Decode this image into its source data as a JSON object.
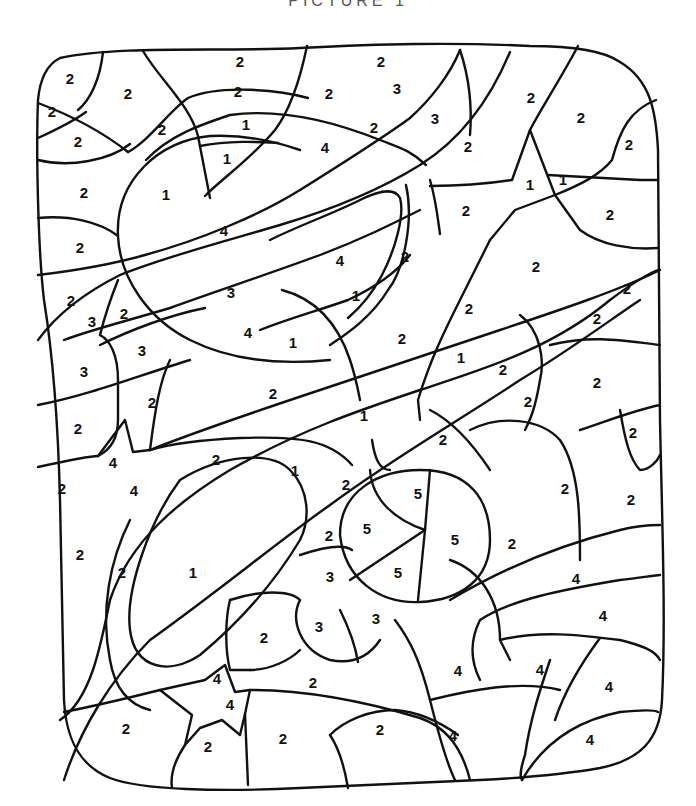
{
  "page": {
    "title": "PICTURE 1",
    "line_color": "#111111",
    "background": "#ffffff"
  },
  "numbers": [
    {
      "v": "2",
      "x": 70,
      "y": 80
    },
    {
      "v": "2",
      "x": 128,
      "y": 95
    },
    {
      "v": "2",
      "x": 52,
      "y": 113
    },
    {
      "v": "2",
      "x": 78,
      "y": 143
    },
    {
      "v": "2",
      "x": 240,
      "y": 63
    },
    {
      "v": "2",
      "x": 238,
      "y": 93
    },
    {
      "v": "2",
      "x": 162,
      "y": 131
    },
    {
      "v": "1",
      "x": 246,
      "y": 126
    },
    {
      "v": "1",
      "x": 227,
      "y": 160
    },
    {
      "v": "2",
      "x": 84,
      "y": 194
    },
    {
      "v": "1",
      "x": 166,
      "y": 196
    },
    {
      "v": "4",
      "x": 224,
      "y": 232
    },
    {
      "v": "2",
      "x": 80,
      "y": 249
    },
    {
      "v": "2",
      "x": 381,
      "y": 63
    },
    {
      "v": "2",
      "x": 329,
      "y": 95
    },
    {
      "v": "3",
      "x": 397,
      "y": 90
    },
    {
      "v": "2",
      "x": 374,
      "y": 129
    },
    {
      "v": "3",
      "x": 435,
      "y": 120
    },
    {
      "v": "4",
      "x": 325,
      "y": 149
    },
    {
      "v": "2",
      "x": 468,
      "y": 148
    },
    {
      "v": "2",
      "x": 531,
      "y": 99
    },
    {
      "v": "2",
      "x": 581,
      "y": 119
    },
    {
      "v": "2",
      "x": 629,
      "y": 146
    },
    {
      "v": "1",
      "x": 530,
      "y": 186
    },
    {
      "v": "1",
      "x": 563,
      "y": 181
    },
    {
      "v": "2",
      "x": 466,
      "y": 212
    },
    {
      "v": "2",
      "x": 610,
      "y": 216
    },
    {
      "v": "2",
      "x": 536,
      "y": 268
    },
    {
      "v": "2",
      "x": 627,
      "y": 290
    },
    {
      "v": "4",
      "x": 340,
      "y": 262
    },
    {
      "v": "2",
      "x": 405,
      "y": 258
    },
    {
      "v": "1",
      "x": 356,
      "y": 297
    },
    {
      "v": "3",
      "x": 231,
      "y": 294
    },
    {
      "v": "2",
      "x": 71,
      "y": 302
    },
    {
      "v": "3",
      "x": 92,
      "y": 323
    },
    {
      "v": "2",
      "x": 124,
      "y": 315
    },
    {
      "v": "4",
      "x": 248,
      "y": 334
    },
    {
      "v": "1",
      "x": 293,
      "y": 344
    },
    {
      "v": "3",
      "x": 142,
      "y": 352
    },
    {
      "v": "3",
      "x": 84,
      "y": 373
    },
    {
      "v": "2",
      "x": 469,
      "y": 310
    },
    {
      "v": "2",
      "x": 597,
      "y": 320
    },
    {
      "v": "2",
      "x": 402,
      "y": 340
    },
    {
      "v": "1",
      "x": 461,
      "y": 359
    },
    {
      "v": "2",
      "x": 503,
      "y": 371
    },
    {
      "v": "2",
      "x": 597,
      "y": 384
    },
    {
      "v": "2",
      "x": 528,
      "y": 403
    },
    {
      "v": "2",
      "x": 273,
      "y": 395
    },
    {
      "v": "2",
      "x": 152,
      "y": 404
    },
    {
      "v": "1",
      "x": 364,
      "y": 417
    },
    {
      "v": "2",
      "x": 78,
      "y": 430
    },
    {
      "v": "2",
      "x": 633,
      "y": 434
    },
    {
      "v": "2",
      "x": 443,
      "y": 441
    },
    {
      "v": "4",
      "x": 113,
      "y": 464
    },
    {
      "v": "2",
      "x": 216,
      "y": 461
    },
    {
      "v": "1",
      "x": 295,
      "y": 472
    },
    {
      "v": "2",
      "x": 62,
      "y": 490
    },
    {
      "v": "4",
      "x": 134,
      "y": 492
    },
    {
      "v": "2",
      "x": 346,
      "y": 486
    },
    {
      "v": "5",
      "x": 418,
      "y": 495
    },
    {
      "v": "2",
      "x": 565,
      "y": 490
    },
    {
      "v": "2",
      "x": 631,
      "y": 501
    },
    {
      "v": "5",
      "x": 367,
      "y": 530
    },
    {
      "v": "2",
      "x": 329,
      "y": 537
    },
    {
      "v": "5",
      "x": 455,
      "y": 541
    },
    {
      "v": "2",
      "x": 512,
      "y": 545
    },
    {
      "v": "2",
      "x": 80,
      "y": 556
    },
    {
      "v": "2",
      "x": 122,
      "y": 574
    },
    {
      "v": "1",
      "x": 193,
      "y": 574
    },
    {
      "v": "3",
      "x": 330,
      "y": 578
    },
    {
      "v": "5",
      "x": 398,
      "y": 574
    },
    {
      "v": "4",
      "x": 576,
      "y": 580
    },
    {
      "v": "3",
      "x": 376,
      "y": 620
    },
    {
      "v": "3",
      "x": 319,
      "y": 628
    },
    {
      "v": "4",
      "x": 603,
      "y": 617
    },
    {
      "v": "2",
      "x": 264,
      "y": 639
    },
    {
      "v": "4",
      "x": 458,
      "y": 672
    },
    {
      "v": "4",
      "x": 540,
      "y": 671
    },
    {
      "v": "4",
      "x": 609,
      "y": 688
    },
    {
      "v": "4",
      "x": 217,
      "y": 680
    },
    {
      "v": "2",
      "x": 313,
      "y": 684
    },
    {
      "v": "4",
      "x": 230,
      "y": 706
    },
    {
      "v": "2",
      "x": 126,
      "y": 730
    },
    {
      "v": "2",
      "x": 380,
      "y": 731
    },
    {
      "v": "4",
      "x": 453,
      "y": 737
    },
    {
      "v": "2",
      "x": 208,
      "y": 748
    },
    {
      "v": "2",
      "x": 283,
      "y": 740
    },
    {
      "v": "4",
      "x": 590,
      "y": 741
    }
  ]
}
